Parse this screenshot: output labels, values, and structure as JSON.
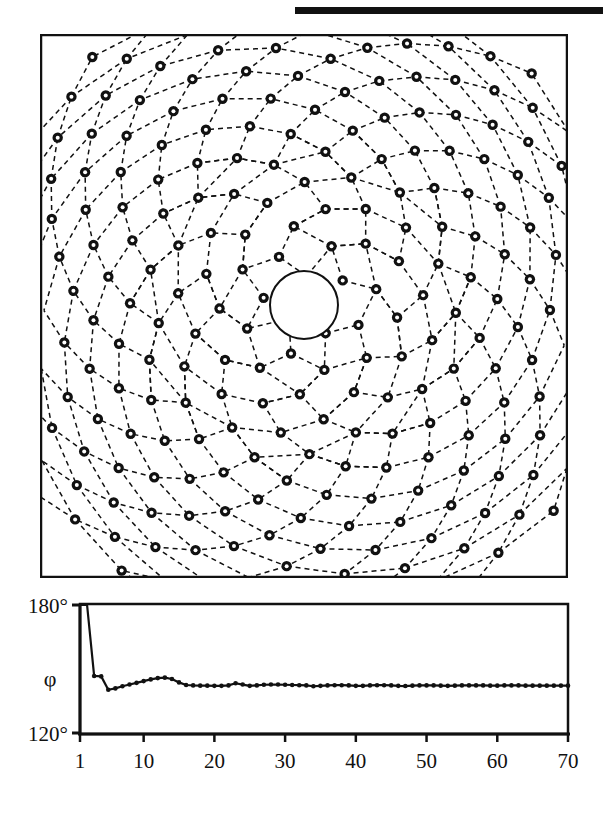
{
  "figure": {
    "title_rule": "black-horizontal-rule",
    "background_color": "#ffffff",
    "ink_color": "#111111"
  },
  "spiral_panel": {
    "name": "phyllotaxis-spiral-diagram",
    "description": "Vogel spiral point lattice with dashed parastichy curves and an empty circular core",
    "frame": {
      "x": 40,
      "y": 34,
      "width": 528,
      "height": 544,
      "border_color": "#111111"
    },
    "center": {
      "x": 264,
      "y": 271
    },
    "core_radius": 34,
    "marker": {
      "style": "ring",
      "outer_r": 5.2,
      "inner_r": 2.0,
      "fill": "#111111",
      "hole": "#ffffff"
    },
    "divergence_angle_deg": 137.508,
    "scale_c": 20.5,
    "n_points": 260,
    "parastichy_families": [
      8,
      13,
      21
    ],
    "dash_pattern": "5 4"
  },
  "chart_data": {
    "type": "line",
    "name": "divergence-angle-convergence",
    "title": "",
    "xlabel": "",
    "ylabel": "φ",
    "xlim": [
      1,
      70
    ],
    "ylim": [
      120,
      180
    ],
    "grid": false,
    "legend": null,
    "yticks": [
      120,
      180
    ],
    "yticklabels": [
      "120°",
      "180°"
    ],
    "xticks": [
      1,
      10,
      20,
      30,
      40,
      50,
      60,
      70
    ],
    "xticklabels": [
      "1",
      "10",
      "20",
      "30",
      "40",
      "50",
      "60",
      "70"
    ],
    "marker": "dot",
    "x": [
      1,
      2,
      3,
      4,
      5,
      6,
      7,
      8,
      9,
      10,
      11,
      12,
      13,
      14,
      15,
      16,
      17,
      18,
      19,
      20,
      21,
      22,
      23,
      24,
      25,
      26,
      27,
      28,
      29,
      30,
      31,
      32,
      33,
      34,
      35,
      36,
      37,
      38,
      39,
      40,
      41,
      42,
      43,
      44,
      45,
      46,
      47,
      48,
      49,
      50,
      51,
      52,
      53,
      54,
      55,
      56,
      57,
      58,
      59,
      60,
      61,
      62,
      63,
      64,
      65,
      66,
      67,
      68,
      69,
      70
    ],
    "values": [
      180.0,
      180.0,
      147.0,
      146.8,
      140.6,
      141.2,
      142.2,
      143.0,
      143.8,
      144.6,
      145.4,
      146.0,
      146.2,
      145.6,
      144.0,
      142.8,
      142.6,
      142.5,
      142.5,
      142.4,
      142.4,
      142.6,
      143.6,
      143.0,
      142.4,
      142.6,
      142.9,
      143.0,
      143.0,
      142.9,
      142.8,
      142.7,
      142.6,
      142.2,
      142.4,
      142.6,
      142.7,
      142.7,
      142.6,
      142.4,
      142.4,
      142.6,
      142.7,
      142.7,
      142.6,
      142.4,
      142.3,
      142.5,
      142.6,
      142.6,
      142.6,
      142.5,
      142.4,
      142.5,
      142.6,
      142.6,
      142.6,
      142.6,
      142.5,
      142.5,
      142.6,
      142.6,
      142.6,
      142.5,
      142.5,
      142.5,
      142.5,
      142.5,
      142.5,
      142.5
    ]
  }
}
